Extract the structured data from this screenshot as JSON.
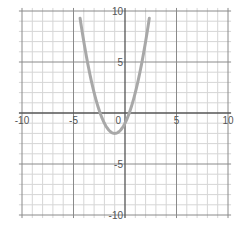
{
  "chart_data": {
    "type": "line",
    "title": "",
    "xlabel": "",
    "ylabel": "",
    "xlim": [
      -10,
      10
    ],
    "ylim": [
      -10,
      10
    ],
    "grid": true,
    "minor_step": 1,
    "major_step": 5,
    "x_ticks": [
      "-10",
      "-5",
      "0",
      "5",
      "10"
    ],
    "y_ticks": [
      "10",
      "5",
      "-5",
      "-10"
    ],
    "series": [
      {
        "name": "parabola",
        "expression": "y = x^2 + 2x - 1",
        "vertex": [
          -1,
          -2
        ],
        "roots": [
          -2.41,
          0.41
        ],
        "x": [
          -4.46,
          -4,
          -3,
          -2,
          -1,
          0,
          1,
          2,
          2.46
        ],
        "y": [
          10,
          7,
          2,
          -1,
          -2,
          -1,
          2,
          7,
          10
        ],
        "color": "#a8a8a8"
      }
    ]
  },
  "colors": {
    "axis": "#555555",
    "major_grid": "#8a8a8a",
    "minor_grid": "#d6d6d6",
    "curve": "#a8a8a8"
  }
}
